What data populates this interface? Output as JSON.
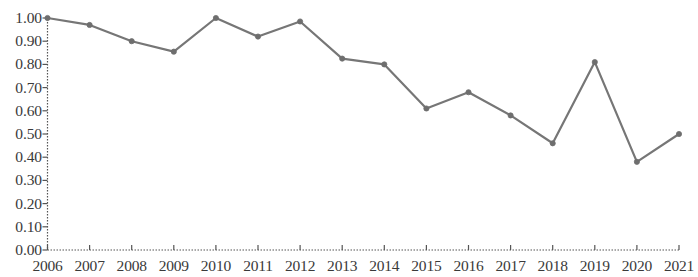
{
  "chart_data": {
    "type": "line",
    "title": "",
    "subtitle": "",
    "xlabel": "",
    "ylabel": "",
    "grid": false,
    "legend": null,
    "legend_position": "none",
    "line_color": "#767676",
    "marker_color": "#6e6e6e",
    "axis_color": "#555555",
    "ylim": [
      0.0,
      1.0
    ],
    "ytick_labels": [
      "0.00",
      "0.10",
      "0.20",
      "0.30",
      "0.40",
      "0.50",
      "0.60",
      "0.70",
      "0.80",
      "0.90",
      "1.00"
    ],
    "ytick_values": [
      0.0,
      0.1,
      0.2,
      0.3,
      0.4,
      0.5,
      0.6,
      0.7,
      0.8,
      0.9,
      1.0
    ],
    "categories": [
      "2006",
      "2007",
      "2008",
      "2009",
      "2010",
      "2011",
      "2012",
      "2013",
      "2014",
      "2015",
      "2016",
      "2017",
      "2018",
      "2019",
      "2020",
      "2021"
    ],
    "values": [
      1.0,
      0.97,
      0.9,
      0.855,
      1.0,
      0.92,
      0.985,
      0.825,
      0.8,
      0.61,
      0.68,
      0.58,
      0.46,
      0.81,
      0.38,
      0.5
    ]
  }
}
